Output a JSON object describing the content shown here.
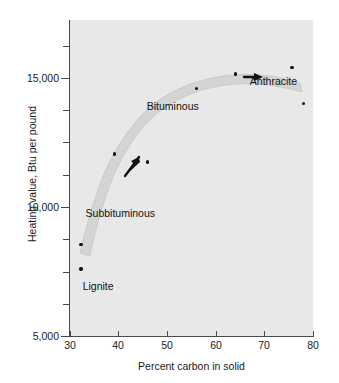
{
  "chart_data": {
    "type": "scatter",
    "title": "",
    "xlabel": "Percent carbon in solid",
    "ylabel": "Heating value, Btu per pound",
    "xlim": [
      30,
      80
    ],
    "ylim": [
      5000,
      17250
    ],
    "xticks": [
      30,
      40,
      50,
      60,
      70,
      80
    ],
    "xticklabels": [
      "30",
      "40",
      "50",
      "60",
      "70",
      "80"
    ],
    "yticks": [
      5000,
      10000,
      15000
    ],
    "yticklabels": [
      "5,000",
      "10,000",
      "15,000"
    ],
    "yminorticks": [
      6250,
      7500,
      8750,
      11250,
      12500,
      13750,
      16250,
      17500
    ],
    "grid": false,
    "legend": "none",
    "background": "#e8e8e8",
    "point_color": "#111111",
    "band_color": "#d2d2d2",
    "points": [
      {
        "x": 32.3,
        "y": 7600
      },
      {
        "x": 32.3,
        "y": 8550
      },
      {
        "x": 39.1,
        "y": 12050
      },
      {
        "x": 45.9,
        "y": 11750
      },
      {
        "x": 56.0,
        "y": 14600
      },
      {
        "x": 64.0,
        "y": 15150
      },
      {
        "x": 75.7,
        "y": 15400
      },
      {
        "x": 78.0,
        "y": 14000
      }
    ],
    "trend_band": {
      "description": "shaded ribbon rising from lignite through bituminous to anthracite plateau",
      "upper": [
        [
          32.0,
          8200
        ],
        [
          38.0,
          11300
        ],
        [
          44.0,
          13300
        ],
        [
          50.0,
          14700
        ],
        [
          56.0,
          15450
        ],
        [
          64.0,
          15800
        ],
        [
          72.0,
          15700
        ],
        [
          78.0,
          15100
        ]
      ],
      "lower": [
        [
          32.0,
          7300
        ],
        [
          38.0,
          10300
        ],
        [
          44.0,
          12450
        ],
        [
          50.0,
          13950
        ],
        [
          56.0,
          14750
        ],
        [
          64.0,
          15150
        ],
        [
          72.0,
          15050
        ],
        [
          78.0,
          14400
        ]
      ]
    },
    "annotations": [
      {
        "text": "Lignite",
        "x": 32.6,
        "y": 6950
      },
      {
        "text": "Subbituminous",
        "x": 33.2,
        "y": 9750
      },
      {
        "text": "Bituminous",
        "x": 45.8,
        "y": 13900
      },
      {
        "text": "Anthracite",
        "x": 67.0,
        "y": 14900
      }
    ],
    "arrows": [
      {
        "x": 42.5,
        "y": 11700,
        "angle_deg": -55,
        "name": "trend-arrow-lower"
      },
      {
        "x": 67.0,
        "y": 15450,
        "angle_deg": 0,
        "name": "trend-arrow-upper"
      }
    ]
  }
}
